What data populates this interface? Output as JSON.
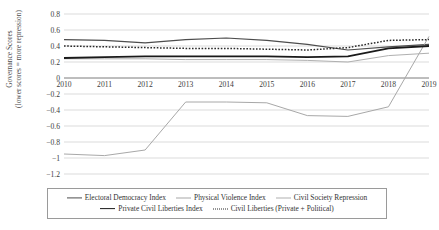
{
  "chart_data": {
    "type": "line",
    "title": "",
    "xlabel": "",
    "ylabel": "Governance Scores (lower scores = more repression)",
    "ylabel_line1": "Governance Scores",
    "ylabel_line2": "(lower scores = more repression)",
    "x": [
      2010,
      2011,
      2012,
      2013,
      2014,
      2015,
      2016,
      2017,
      2018,
      2019
    ],
    "categories": [
      "2010",
      "2011",
      "2012",
      "2013",
      "2014",
      "2015",
      "2016",
      "2017",
      "2018",
      "2019"
    ],
    "ylim": [
      -1.2,
      0.8
    ],
    "yticks": [
      0.8,
      0.6,
      0.4,
      0.2,
      0,
      -0.2,
      -0.4,
      -0.6,
      -0.8,
      -1,
      -1.2
    ],
    "ytick_labels": [
      "0.8",
      "0.6",
      "0.4",
      "0.2",
      "0",
      "−0.2",
      "−0.4",
      "−0.6",
      "−0.8",
      "−1",
      "−1.2"
    ],
    "grid": true,
    "legend_position": "bottom",
    "series": [
      {
        "name": "Electoral Democracy Index",
        "style": "solid",
        "color": "#4d4d4d",
        "width": 1.2,
        "values": [
          0.48,
          0.47,
          0.44,
          0.48,
          0.5,
          0.47,
          0.42,
          0.35,
          0.39,
          0.42
        ]
      },
      {
        "name": "Physical Violence Index",
        "style": "solid",
        "color": "#a8a8a8",
        "width": 1.0,
        "values": [
          -0.95,
          -0.97,
          -0.9,
          -0.3,
          -0.3,
          -0.31,
          -0.47,
          -0.48,
          -0.36,
          0.52
        ]
      },
      {
        "name": "Civil Society Repression",
        "style": "solid",
        "color": "#b0b0b0",
        "width": 1.0,
        "values": [
          0.24,
          0.24,
          0.24,
          0.23,
          0.23,
          0.23,
          0.22,
          0.2,
          0.28,
          0.31
        ]
      },
      {
        "name": "Private Civil Liberties Index",
        "style": "solid",
        "color": "#1a1a1a",
        "width": 1.8,
        "values": [
          0.25,
          0.26,
          0.27,
          0.27,
          0.27,
          0.27,
          0.26,
          0.27,
          0.37,
          0.4
        ]
      },
      {
        "name": "Civil Liberties (Private + Political)",
        "style": "dotted",
        "color": "#2a2a2a",
        "width": 1.5,
        "values": [
          0.4,
          0.39,
          0.38,
          0.37,
          0.37,
          0.36,
          0.35,
          0.38,
          0.47,
          0.48
        ]
      }
    ]
  },
  "legend": {
    "row1": [
      "Electoral Democracy Index",
      "Physical Violence Index",
      "Civil Society Repression"
    ],
    "row2": [
      "Private Civil Liberties Index",
      "Civil Liberties (Private + Political)"
    ]
  }
}
